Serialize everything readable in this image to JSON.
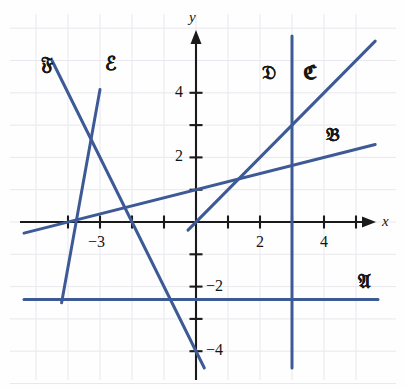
{
  "figure": {
    "kind": "coordinate-plane-line-graph",
    "background_color": "#fefefe",
    "line_color": "#3d5a96",
    "axis_color": "#1a1a1a",
    "grid_color": "#e8e8ee"
  },
  "axes": {
    "x_label": "x",
    "y_label": "y",
    "x_ticks": [
      -4,
      -3,
      -2,
      -1,
      1,
      2,
      3,
      4,
      5
    ],
    "y_ticks": [
      -4,
      -3,
      -2,
      -1,
      1,
      2,
      3,
      4
    ],
    "x_tick_labels": [
      {
        "value": -3,
        "text": "−3"
      },
      {
        "value": 2,
        "text": "2"
      },
      {
        "value": 4,
        "text": "4"
      }
    ],
    "y_tick_labels": [
      {
        "value": 4,
        "text": "4"
      },
      {
        "value": 2,
        "text": "2"
      },
      {
        "value": -2,
        "text": "−2"
      },
      {
        "value": -4,
        "text": "−4"
      }
    ],
    "xlim": [
      -5.4,
      6.5
    ],
    "ylim": [
      -5.0,
      6.0
    ],
    "grid": true
  },
  "chart_data": {
    "type": "line",
    "title": "",
    "xlabel": "x",
    "ylabel": "y",
    "xlim": [
      -5.4,
      6.5
    ],
    "ylim": [
      -5.0,
      6.0
    ],
    "grid": true,
    "legend_position": "inline-labels",
    "series": [
      {
        "name": "A",
        "label": "𝔄",
        "label_text": "A",
        "equation": "y = -2.4",
        "kind": "horizontal",
        "slope": 0,
        "intercept": -2.4,
        "label_x": 5.3,
        "label_y": -1.85,
        "x_range": [
          -5.4,
          6.3
        ]
      },
      {
        "name": "B",
        "label": "𝔅",
        "label_text": "B",
        "equation": "y = 0.25x + 1",
        "kind": "oblique",
        "slope": 0.25,
        "intercept": 1,
        "label_x": 4.3,
        "label_y": 2.7,
        "x_range": [
          -5.4,
          5.6
        ]
      },
      {
        "name": "C",
        "label": "ℭ",
        "label_text": "C",
        "equation": "y = x",
        "kind": "oblique",
        "slope": 1,
        "intercept": 0,
        "label_x": 3.6,
        "label_y": 4.6,
        "x_range": [
          -0.25,
          5.6
        ]
      },
      {
        "name": "D",
        "label": "𝔇",
        "label_text": "D",
        "equation": "x = 3",
        "kind": "vertical",
        "x_value": 3,
        "label_x": 2.3,
        "label_y": 4.6,
        "y_range": [
          -5.0,
          5.9
        ]
      },
      {
        "name": "E",
        "label": "ℰ",
        "label_text": "E",
        "equation": "y = 5.5x + 20.6",
        "kind": "oblique",
        "slope": 5.5,
        "intercept": 20.6,
        "label_x": -2.6,
        "label_y": 4.9,
        "x_range": [
          -4.2,
          -3.0
        ]
      },
      {
        "name": "F",
        "label": "𝔉",
        "label_text": "F",
        "equation": "y = -2x - 4",
        "kind": "oblique",
        "slope": -2,
        "intercept": -4,
        "label_x": -4.6,
        "label_y": 4.9,
        "x_range": [
          -4.5,
          0.45
        ]
      }
    ]
  },
  "labels": {
    "x_axis": "x",
    "y_axis": "y",
    "line_a": "𝔄",
    "line_b": "𝔅",
    "line_c": "ℭ",
    "line_d": "𝔇",
    "line_e": "ℰ",
    "line_f": "𝔉",
    "tick_neg3": "−3",
    "tick_2": "2",
    "tick_4": "4",
    "tick_y4": "4",
    "tick_y2": "2",
    "tick_yneg2": "−2",
    "tick_yneg4": "−4"
  }
}
